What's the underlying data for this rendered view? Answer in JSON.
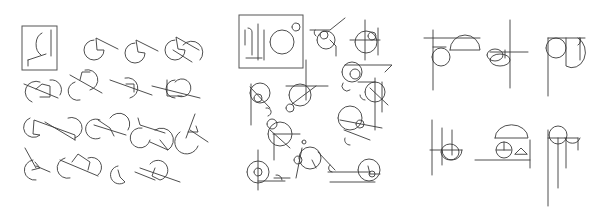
{
  "figure": {
    "width": 601,
    "height": 208,
    "stroke_color": "#3a3a3a",
    "background": "#ffffff",
    "panels": [
      {
        "id": "panel-a",
        "reference_box": {
          "x": 22,
          "y": 26,
          "w": 35,
          "h": 44
        },
        "sketches": [
          {
            "type": "ref",
            "paths": [
              "M42 33 A9 12 0 0 0 41 55",
              "M51 30 L51 56",
              "M28 60 L46 54",
              "M28 60 L28 66"
            ]
          },
          {
            "type": "sketch",
            "paths": [
              "M94 40 A10 10 0 1 0 104 50 L97 50 L96 38 L118 49"
            ]
          },
          {
            "type": "sketch",
            "paths": [
              "M135 43 A10 10 0 1 0 145 53 L138 52 L136 40 L158 51"
            ]
          },
          {
            "type": "sketch",
            "paths": [
              "M175 40 A10 10 0 1 0 185 50 L178 49 L176 37 L199 50",
              "M183 45 A10 10 0 0 1 200 60",
              "M173 50 L192 62"
            ]
          },
          {
            "type": "sketch",
            "paths": [
              "M40 82 A10 10 0 1 0 32 102",
              "M24 84 L58 98",
              "M36 89 L42 84 L50 86 L50 97 L40 97",
              "M50 80 A10 10 0 0 1 60 95"
            ]
          },
          {
            "type": "sketch",
            "paths": [
              "M85 70 A9 9 0 1 1 90 90",
              "M70 75 L102 93",
              "M80 80 L82 72 L90 72",
              "M75 82 A9 9 0 1 0 80 100"
            ]
          },
          {
            "type": "sketch",
            "paths": [
              "M125 78 A9 9 0 1 1 130 98",
              "M110 80 L152 95",
              "M126 84 L134 84 L134 92"
            ]
          },
          {
            "type": "sketch",
            "paths": [
              "M175 80 A9 9 0 1 0 175 98",
              "M152 86 L200 98",
              "M167 80 L167 96 L182 96 M175 82 A9 9 0 1 1 178 96"
            ]
          },
          {
            "type": "sketch",
            "paths": [
              "M30 118 A10 10 0 1 0 40 135 L33 134 L34 120 L75 135 L75 140"
            ]
          },
          {
            "type": "sketch",
            "paths": [
              "M68 118 A10 10 0 1 1 75 138",
              "M45 122 L75 140"
            ]
          },
          {
            "type": "sketch",
            "paths": [
              "M100 120 A10 10 0 1 0 100 138",
              "M94 125 L126 135",
              "M98 120 L110 128 L114 136",
              "M110 118 A10 10 0 0 1 128 130"
            ]
          },
          {
            "type": "sketch",
            "paths": [
              "M138 118 L140 125 L165 133",
              "M142 128 A10 10 0 1 0 150 140",
              "M155 130 A10 10 0 1 1 168 150",
              "M150 142 L168 150 L160 140"
            ]
          },
          {
            "type": "sketch",
            "paths": [
              "M195 114 L186 138",
              "M190 130 L208 142",
              "M188 132 L198 132 L196 126",
              "M180 132 A12 12 0 1 0 198 146"
            ]
          },
          {
            "type": "sketch",
            "paths": [
              "M25 148 L36 168",
              "M33 160 A10 10 0 1 0 36 180",
              "M36 166 L50 172",
              "M35 162 L40 168 L32 170"
            ]
          },
          {
            "type": "sketch",
            "paths": [
              "M65 158 A9 9 0 1 0 70 178",
              "M60 160 L98 176",
              "M72 162 L78 154 L90 162 L88 170",
              "M88 158 A10 10 0 0 1 98 175"
            ]
          },
          {
            "type": "sketch",
            "paths": [
              "M118 166 A9 9 0 1 0 125 182 L120 177 L118 170",
              "M135 172 L155 180"
            ]
          },
          {
            "type": "sketch",
            "paths": [
              "M150 164 A10 10 0 1 1 160 180 L152 176 L155 168",
              "M140 168 L180 182"
            ]
          }
        ]
      },
      {
        "id": "panel-b",
        "reference_box": {
          "x": 239,
          "y": 15,
          "w": 64,
          "h": 53
        },
        "sketches": [
          {
            "type": "ref",
            "paths": [
              "M245 30 L245 45 M248 28 A4 4 0 0 1 252 32 L252 55",
              "M258 24 L258 60",
              "M246 58 L262 58",
              "M264 30 L264 60"
            ]
          },
          {
            "type": "ref",
            "paths": [
              "M282 42 m-12 0 a12 12 0 1 0 24 0 a12 12 0 1 0 -24 0",
              "M296 27 m-4 0 a4 4 0 1 0 8 0 a4 4 0 1 0 -8 0"
            ]
          },
          {
            "type": "sketch",
            "paths": [
              "M326 40 m-9 0 a9 9 0 1 0 18 0 a9 9 0 1 0 -18 0",
              "M324 35 m-4 0 a4 4 0 1 0 8 0 a4 4 0 1 0 -8 0",
              "M310 30 L330 30 L345 18",
              "M315 30 A4 4 0 0 0 316 36",
              "M330 40 L336 46 L336 56"
            ]
          },
          {
            "type": "sketch",
            "paths": [
              "M366 42 m-11 0 a11 11 0 1 0 22 0 a11 11 0 1 0 -22 0",
              "M372 36 m-4 0 a4 4 0 1 0 8 0 a4 4 0 1 0 -8 0",
              "M365 20 L365 60",
              "M350 40 L380 40",
              "M378 28 L378 55"
            ]
          },
          {
            "type": "sketch",
            "paths": [
              "M352 72 m-10 0 a10 10 0 1 0 20 0 a10 10 0 1 0 -20 0",
              "M355 74 m-5 0 a5 5 0 1 0 10 0 a5 5 0 1 0 -10 0",
              "M345 65 L392 65 L385 72",
              "M343 83 A5 5 0 0 0 350 90",
              "M358 82 L375 82"
            ]
          },
          {
            "type": "sketch",
            "paths": [
              "M260 93 m-10 0 a10 10 0 1 0 20 0 a10 10 0 1 0 -20 0",
              "M258 98 m-4 0 a4 4 0 1 0 8 0 a4 4 0 1 0 -8 0",
              "M251 84 L251 125",
              "M250 87 L270 108",
              "M266 108 A4 4 0 0 1 268 116"
            ]
          },
          {
            "type": "sketch",
            "paths": [
              "M300 95 m-11 0 a11 11 0 1 0 22 0 a11 11 0 1 0 -22 0",
              "M306 60 L306 100",
              "M286 86 L328 86",
              "M292 104 L316 86",
              "M290 108 m-4 0 a4 4 0 1 0 8 0 a4 4 0 1 0 -8 0"
            ]
          },
          {
            "type": "sketch",
            "paths": [
              "M375 92 m-10 0 a10 10 0 1 0 20 0 a10 10 0 1 0 -20 0",
              "M370 88 L388 105",
              "M375 78 L375 130",
              "M382 82 L382 112",
              "M360 95 A5 5 0 0 0 365 100"
            ]
          },
          {
            "type": "sketch",
            "paths": [
              "M280 134 m-12 0 a12 12 0 1 0 24 0 a12 12 0 1 0 -24 0",
              "M272 124 m-5 0 a5 5 0 1 0 10 0 a5 5 0 1 0 -10 0",
              "M273 134 L300 134",
              "M270 130 L290 148",
              "M274 134 L274 160"
            ]
          },
          {
            "type": "sketch",
            "paths": [
              "M350 118 m-12 0 a12 12 0 1 0 24 0 a12 12 0 1 0 -24 0",
              "M360 124 m-4 0 a4 4 0 1 0 8 0 a4 4 0 1 0 -8 0",
              "M340 120 L382 128",
              "M344 130 L370 140",
              "M345 138 A5 5 0 0 0 350 145"
            ]
          },
          {
            "type": "sketch",
            "paths": [
              "M310 158 m-11 0 a11 11 0 1 0 22 0 a11 11 0 1 0 -22 0",
              "M298 160 m-4 0 a4 4 0 1 0 8 0 a4 4 0 1 0 -8 0",
              "M304 142 m-2 0 a2 2 0 1 0 4 0 a2 2 0 1 0 -4 0",
              "M302 148 L296 178",
              "M318 152 L335 170",
              "M312 160 L316 168"
            ]
          },
          {
            "type": "sketch",
            "paths": [
              "M258 172 m-11 0 a11 11 0 1 0 22 0 a11 11 0 1 0 -22 0",
              "M258 172 m-4 0 a4 4 0 1 0 8 0 a4 4 0 1 0 -8 0",
              "M258 150 L258 190",
              "M258 181 L285 181",
              "M276 175 A5 5 0 0 1 282 180",
              "M274 178 L290 178"
            ]
          },
          {
            "type": "sketch",
            "paths": [
              "M369 170 m-11 0 a11 11 0 1 0 22 0 a11 11 0 1 0 -22 0",
              "M372 174 m-3 0 a3 3 0 1 0 6 0 a3 3 0 1 0 -6 0",
              "M368 166 L370 174 L380 174",
              "M328 172 L370 172",
              "M330 182 L375 182",
              "M330 165 A4 4 0 0 0 332 172"
            ]
          }
        ]
      },
      {
        "id": "panel-c",
        "sketches": [
          {
            "type": "sketch",
            "paths": [
              "M424 38 L480 38",
              "M433 30 L433 90",
              "M441 57 m-9 0 a9 9 0 1 0 18 0 a9 9 0 1 0 -18 0",
              "M450 50 A15 15 0 0 1 480 50 L450 50",
              "M433 47 L446 47"
            ]
          },
          {
            "type": "sketch",
            "paths": [
              "M510 20 L510 88",
              "M490 52 L528 52",
              "M500 60 m-10 0 a10 6 0 1 0 20 0 a10 6 0 1 0 -20 0",
              "M495 55 m-8 0 a8 6 0 1 0 16 0 a8 6 0 1 0 -16 0",
              "M505 50 L505 58"
            ]
          },
          {
            "type": "sketch",
            "paths": [
              "M548 38 L585 38",
              "M548 38 L548 96",
              "M556 48 m-10 0 a10 10 0 1 0 20 0 a10 10 0 1 0 -20 0",
              "M566 38 L566 66 A12 14 0 0 0 578 38",
              "M580 38 L580 60",
              "M578 45 A5 5 0 0 0 580 38"
            ]
          },
          {
            "type": "sketch",
            "paths": [
              "M432 120 L432 175",
              "M442 128 L442 165",
              "M442 150 A10 10 0 0 0 462 150",
              "M430 150 L462 150",
              "M452 130 L452 155",
              "M450 152 m-9 0 a9 8 0 1 0 18 0 a9 8 0 1 0 -18 0"
            ]
          },
          {
            "type": "sketch",
            "paths": [
              "M475 160 L530 160",
              "M495 138 A15 12 0 0 1 528 138 L495 138",
              "M504 150 m-8 0 a8 8 0 1 0 16 0 a8 8 0 1 0 -16 0",
              "M497 150 L511 150",
              "M504 142 L504 150",
              "M515 154 L521 148 L527 154 Z",
              "M530 140 L530 168"
            ]
          },
          {
            "type": "sketch",
            "paths": [
              "M558 135 m-9 0 a9 9 0 1 0 18 0 a9 9 0 1 0 -18 0",
              "M548 138 L578 138",
              "M558 138 L558 188",
              "M566 138 L566 168",
              "M565 138 A8 8 0 0 0 580 138",
              "M578 138 L578 150",
              "M548 130 L548 206"
            ]
          }
        ]
      }
    ]
  }
}
